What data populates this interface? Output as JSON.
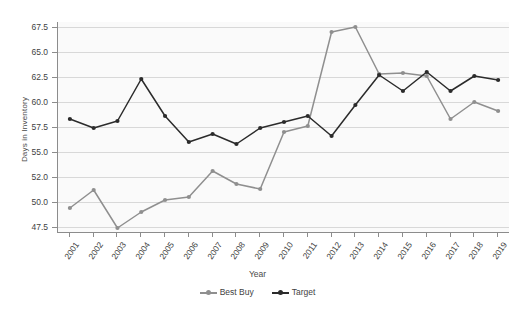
{
  "chart_data": {
    "type": "line",
    "title": "",
    "xlabel": "Year",
    "ylabel": "Days in Inventory",
    "grid": true,
    "legend_position": "bottom",
    "ylim": [
      46.5,
      68.8
    ],
    "yticks": [
      47.5,
      50.0,
      52.0,
      55.0,
      57.5,
      60.0,
      62.5,
      65.0,
      67.5
    ],
    "ytick_labels": [
      "47.5",
      "50.0",
      "52.0",
      "55.0",
      "57.5",
      "60.0",
      "62.5",
      "65.0",
      "67.5"
    ],
    "categories": [
      "2001",
      "2002",
      "2003",
      "2004",
      "2005",
      "2006",
      "2007",
      "2008",
      "2009",
      "2010",
      "2011",
      "2012",
      "2013",
      "2014",
      "2015",
      "2016",
      "2017",
      "2018",
      "2019"
    ],
    "series": [
      {
        "name": "Best Buy",
        "color": "#8f8f8f",
        "marker": "circle",
        "values": [
          49.4,
          51.2,
          47.4,
          49.0,
          50.2,
          50.5,
          53.1,
          51.8,
          51.3,
          57.0,
          57.6,
          67.0,
          67.5,
          62.8,
          62.9,
          62.6,
          58.3,
          60.0,
          59.1
        ]
      },
      {
        "name": "Target",
        "color": "#2b2b2b",
        "marker": "circle",
        "values": [
          58.3,
          57.4,
          58.1,
          62.3,
          58.6,
          56.0,
          56.8,
          55.8,
          57.4,
          58.0,
          58.6,
          56.6,
          59.7,
          62.7,
          61.1,
          63.0,
          61.1,
          62.6,
          62.2
        ]
      }
    ]
  },
  "legend": {
    "items": [
      {
        "label": "Best Buy",
        "color": "#8f8f8f"
      },
      {
        "label": "Target",
        "color": "#2b2b2b"
      }
    ]
  },
  "axes": {
    "x_title": "Year",
    "y_title": "Days in Inventory"
  },
  "colors": {
    "plot_background": "#fafafa",
    "gridline": "#d8d8d8",
    "axis": "#8c8c8c",
    "text": "#3f3f3f",
    "best_buy": "#8f8f8f",
    "target": "#2b2b2b"
  }
}
